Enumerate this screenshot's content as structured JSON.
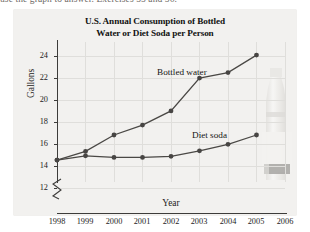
{
  "scan": {
    "top_text": "use the graph to answer. Exercises 55 and 56."
  },
  "figure": {
    "title_line1": "U.S. Annual Consumption of Bottled",
    "title_line2": "Water or Diet Soda per Person",
    "bottle_photo_alt": "water-bottle-photo"
  },
  "chart_data": {
    "type": "line",
    "title": "U.S. Annual Consumption of Bottled Water or Diet Soda per Person",
    "xlabel": "Year",
    "ylabel": "Gallons",
    "x": [
      1998,
      1999,
      2000,
      2001,
      2002,
      2003,
      2004,
      2005
    ],
    "xlim": [
      1998,
      2006
    ],
    "ylim": [
      11.6,
      24.4
    ],
    "xticks": [
      1998,
      1999,
      2000,
      2001,
      2002,
      2003,
      2004,
      2005,
      2006
    ],
    "yticks": [
      12,
      14,
      16,
      18,
      20,
      22,
      24
    ],
    "y_axis_break": true,
    "grid": true,
    "legend_position": "inline-labels",
    "series": [
      {
        "name": "Bottled water",
        "values": [
          13.6,
          14.4,
          15.9,
          16.8,
          18.1,
          21.1,
          21.6,
          23.2
        ]
      },
      {
        "name": "Diet soda",
        "values": [
          13.6,
          14.0,
          13.85,
          13.85,
          13.95,
          14.45,
          15.05,
          15.9
        ]
      }
    ]
  }
}
